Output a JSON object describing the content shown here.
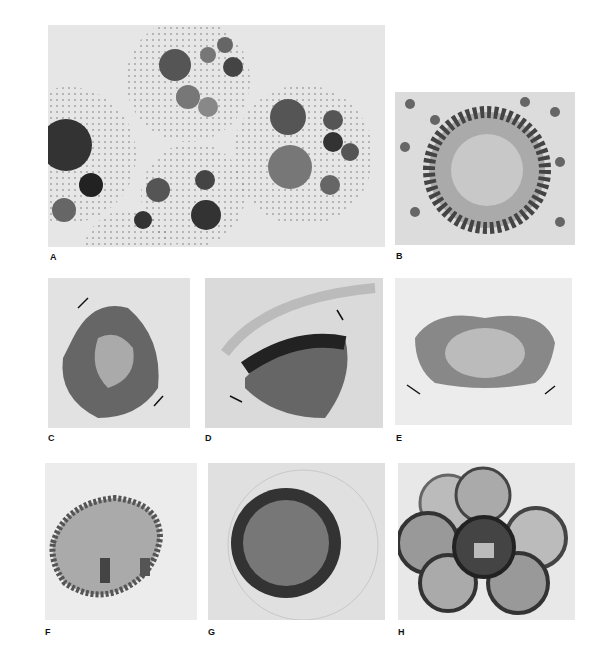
{
  "figure": {
    "panels": [
      {
        "id": "A",
        "label": "A",
        "subject": "several spheroids with developing embryos"
      },
      {
        "id": "B",
        "label": "B",
        "subject": "embryo within parental spheroid, top view"
      },
      {
        "id": "C",
        "label": "C",
        "subject": "embryo beginning inversion, arrows indicate direction"
      },
      {
        "id": "D",
        "label": "D",
        "subject": "embryo mid-inversion, arrows indicate direction"
      },
      {
        "id": "E",
        "label": "E",
        "subject": "inverting embryo, lips curling outward, arrows indicate direction"
      },
      {
        "id": "F",
        "label": "F",
        "subject": "embryo near completion of inversion"
      },
      {
        "id": "G",
        "label": "G",
        "subject": "fully inverted juvenile spheroid"
      },
      {
        "id": "H",
        "label": "H",
        "subject": "cluster of juvenile spheroids"
      }
    ]
  }
}
